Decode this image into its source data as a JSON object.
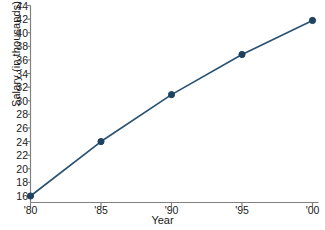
{
  "chart_data": {
    "type": "line",
    "title": "",
    "xlabel": "Year",
    "ylabel": "Salary (in thousands)",
    "categories": [
      "'80",
      "'85",
      "'90",
      "'95",
      "'00"
    ],
    "x": [
      1980,
      1985,
      1990,
      1995,
      2000
    ],
    "values": [
      16.0,
      24.0,
      30.9,
      36.8,
      41.8
    ],
    "series": [
      {
        "name": "Salary",
        "values": [
          16.0,
          24.0,
          30.9,
          36.8,
          41.8
        ]
      }
    ],
    "ylim": [
      16,
      44
    ],
    "ytick_labels": [
      "44",
      "42",
      "40",
      "38",
      "36",
      "34",
      "32",
      "30",
      "28",
      "26",
      "24",
      "22",
      "20",
      "18",
      "16"
    ],
    "ytick_values": [
      44,
      42,
      40,
      38,
      36,
      34,
      32,
      30,
      28,
      26,
      24,
      22,
      20,
      18,
      16
    ],
    "xtick_labels": [
      "'80",
      "'85",
      "'90",
      "'95",
      "'00"
    ],
    "grid": false,
    "legend": "none",
    "marker": "circle",
    "line_color": "#2a5272",
    "marker_color": "#1f4260",
    "axis_color": "#808080",
    "text_color": "#1a1a1a"
  }
}
